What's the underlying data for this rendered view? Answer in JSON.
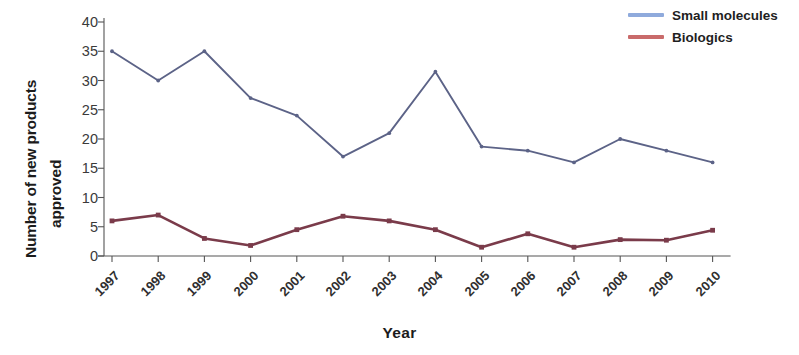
{
  "chart_data": {
    "type": "line",
    "title": "",
    "xlabel": "Year",
    "ylabel": "Number of new products approved",
    "ylabel_lines": [
      "Number of new products",
      "approved"
    ],
    "categories": [
      "1997",
      "1998",
      "1999",
      "2000",
      "2001",
      "2002",
      "2003",
      "2004",
      "2005",
      "2006",
      "2007",
      "2008",
      "2009",
      "2010"
    ],
    "yticks": [
      0,
      5,
      10,
      15,
      20,
      25,
      30,
      35,
      40
    ],
    "ylim": [
      0,
      40
    ],
    "grid": false,
    "legend_position": "top-right",
    "series": [
      {
        "name": "Small molecules",
        "color": "#5C6387",
        "legend_color": "#8FAADC",
        "values": [
          35,
          30,
          35,
          27,
          24,
          17,
          21,
          31.5,
          18.7,
          18,
          16,
          20,
          18,
          16
        ]
      },
      {
        "name": "Biologics",
        "color": "#7A3B4A",
        "legend_color": "#C96B6B",
        "values": [
          6,
          7,
          3,
          1.8,
          4.5,
          6.8,
          6,
          4.5,
          1.5,
          3.8,
          1.5,
          2.8,
          2.7,
          4.4
        ]
      }
    ]
  },
  "legend": {
    "items": [
      {
        "label": "Small molecules"
      },
      {
        "label": "Biologics"
      }
    ]
  },
  "axes": {
    "x_title": "Year",
    "y_title_line1": "Number of new products",
    "y_title_line2": "approved"
  }
}
